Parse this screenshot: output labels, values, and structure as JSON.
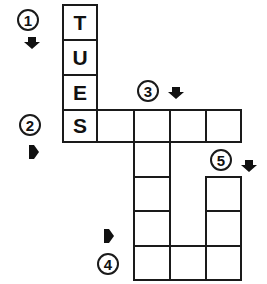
{
  "puzzle": {
    "type": "crossword",
    "cells": [
      {
        "id": "c1",
        "x": 62,
        "y": 4,
        "w": 36,
        "h": 37,
        "letter": "T"
      },
      {
        "id": "c2",
        "x": 62,
        "y": 39,
        "w": 36,
        "h": 37,
        "letter": "U"
      },
      {
        "id": "c3",
        "x": 62,
        "y": 74,
        "w": 36,
        "h": 37,
        "letter": "E"
      },
      {
        "id": "c4",
        "x": 62,
        "y": 109,
        "w": 36,
        "h": 34,
        "letter": "S"
      },
      {
        "id": "c5",
        "x": 96,
        "y": 109,
        "w": 39,
        "h": 34,
        "letter": ""
      },
      {
        "id": "c6",
        "x": 133,
        "y": 109,
        "w": 38,
        "h": 34,
        "letter": ""
      },
      {
        "id": "c7",
        "x": 169,
        "y": 109,
        "w": 38,
        "h": 34,
        "letter": ""
      },
      {
        "id": "c8",
        "x": 205,
        "y": 109,
        "w": 37,
        "h": 34,
        "letter": ""
      },
      {
        "id": "c9",
        "x": 133,
        "y": 141,
        "w": 38,
        "h": 37,
        "letter": ""
      },
      {
        "id": "c10",
        "x": 133,
        "y": 176,
        "w": 38,
        "h": 36,
        "letter": ""
      },
      {
        "id": "c11",
        "x": 133,
        "y": 210,
        "w": 38,
        "h": 37,
        "letter": ""
      },
      {
        "id": "c12",
        "x": 133,
        "y": 245,
        "w": 38,
        "h": 36,
        "letter": ""
      },
      {
        "id": "c13",
        "x": 169,
        "y": 245,
        "w": 38,
        "h": 36,
        "letter": ""
      },
      {
        "id": "c14",
        "x": 205,
        "y": 176,
        "w": 37,
        "h": 36,
        "letter": ""
      },
      {
        "id": "c15",
        "x": 205,
        "y": 210,
        "w": 37,
        "h": 37,
        "letter": ""
      },
      {
        "id": "c16",
        "x": 205,
        "y": 245,
        "w": 37,
        "h": 36,
        "letter": ""
      }
    ],
    "clues": [
      {
        "number": "1",
        "cx": 28,
        "cy": 20,
        "direction": "down",
        "arrow_x": 32,
        "arrow_y": 43
      },
      {
        "number": "2",
        "cx": 30,
        "cy": 125,
        "direction": "across",
        "arrow_x": 34,
        "arrow_y": 152
      },
      {
        "number": "3",
        "cx": 148,
        "cy": 91,
        "direction": "down",
        "arrow_x": 176,
        "arrow_y": 93
      },
      {
        "number": "4",
        "cx": 108,
        "cy": 264,
        "direction": "across",
        "arrow_x": 109,
        "arrow_y": 236
      },
      {
        "number": "5",
        "cx": 221,
        "cy": 160,
        "direction": "down",
        "arrow_x": 249,
        "arrow_y": 166
      }
    ],
    "filled_answer_1_down": "TUES"
  },
  "labels": {
    "c1": "T",
    "c2": "U",
    "c3": "E",
    "c4": "S",
    "clue1": "1",
    "clue2": "2",
    "clue3": "3",
    "clue4": "4",
    "clue5": "5"
  }
}
